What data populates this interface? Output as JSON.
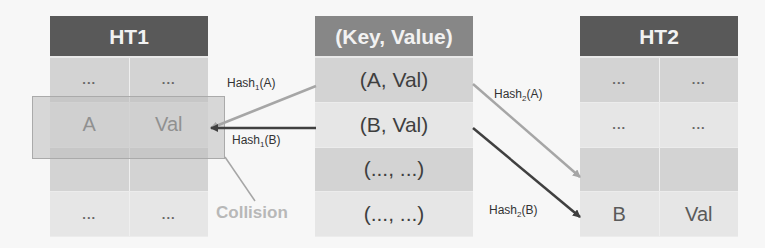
{
  "ht1": {
    "title": "HT1",
    "rows": [
      {
        "key": "...",
        "value": "..."
      },
      {
        "key": "A",
        "value": "Val"
      },
      {
        "key": "",
        "value": ""
      },
      {
        "key": "...",
        "value": "..."
      }
    ]
  },
  "kv": {
    "title": "(Key, Value)",
    "rows": [
      "(A, Val)",
      "(B, Val)",
      "(..., ...)",
      "(..., ...)"
    ]
  },
  "ht2": {
    "title": "HT2",
    "rows": [
      {
        "key": "...",
        "value": "..."
      },
      {
        "key": "...",
        "value": "..."
      },
      {
        "key": "",
        "value": ""
      },
      {
        "key": "B",
        "value": "Val"
      }
    ]
  },
  "arrows": {
    "hash1_a": {
      "name": "Hash",
      "sub": "1",
      "arg": "(A)",
      "color": "#a6a6a6"
    },
    "hash1_b": {
      "name": "Hash",
      "sub": "1",
      "arg": "(B)",
      "color": "#404040"
    },
    "hash2_a": {
      "name": "Hash",
      "sub": "2",
      "arg": "(A)",
      "color": "#a6a6a6"
    },
    "hash2_b": {
      "name": "Hash",
      "sub": "2",
      "arg": "(B)",
      "color": "#404040"
    }
  },
  "collision": {
    "label": "Collision"
  }
}
